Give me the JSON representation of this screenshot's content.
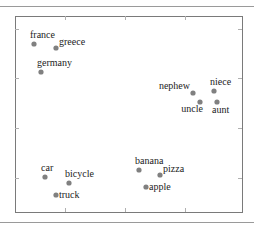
{
  "chart_data": {
    "type": "scatter",
    "title": "",
    "xlabel": "",
    "ylabel": "",
    "grid": false,
    "legend": null,
    "tick_labels": false,
    "points": [
      {
        "label": "france",
        "x": 34,
        "y": 44,
        "label_pos": "above"
      },
      {
        "label": "greece",
        "x": 56,
        "y": 48,
        "label_pos": "right-above"
      },
      {
        "label": "germany",
        "x": 41,
        "y": 72,
        "label_pos": "above"
      },
      {
        "label": "nephew",
        "x": 193,
        "y": 93,
        "label_pos": "left-above"
      },
      {
        "label": "niece",
        "x": 214,
        "y": 91,
        "label_pos": "above"
      },
      {
        "label": "uncle",
        "x": 200,
        "y": 102,
        "label_pos": "below-left"
      },
      {
        "label": "aunt",
        "x": 217,
        "y": 102,
        "label_pos": "below"
      },
      {
        "label": "car",
        "x": 45,
        "y": 177,
        "label_pos": "above"
      },
      {
        "label": "bicycle",
        "x": 69,
        "y": 183,
        "label_pos": "above"
      },
      {
        "label": "truck",
        "x": 56,
        "y": 195,
        "label_pos": "right"
      },
      {
        "label": "banana",
        "x": 139,
        "y": 170,
        "label_pos": "above"
      },
      {
        "label": "pizza",
        "x": 160,
        "y": 175,
        "label_pos": "right-above"
      },
      {
        "label": "apple",
        "x": 146,
        "y": 187,
        "label_pos": "right"
      }
    ],
    "clusters": [
      {
        "name": "countries",
        "members": [
          "france",
          "greece",
          "germany"
        ]
      },
      {
        "name": "family",
        "members": [
          "nephew",
          "niece",
          "uncle",
          "aunt"
        ]
      },
      {
        "name": "vehicles",
        "members": [
          "car",
          "bicycle",
          "truck"
        ]
      },
      {
        "name": "food",
        "members": [
          "banana",
          "pizza",
          "apple"
        ]
      }
    ],
    "frame": {
      "left": 15,
      "top": 16,
      "right": 242,
      "bottom": 212
    },
    "x_ticks_px": [
      65,
      125,
      185
    ],
    "y_ticks_px": [
      29,
      78,
      128,
      178
    ]
  },
  "colors": {
    "point": "#808080",
    "frame": "#7a7a7a",
    "text": "#222222",
    "separator": "#9a9a9a"
  }
}
